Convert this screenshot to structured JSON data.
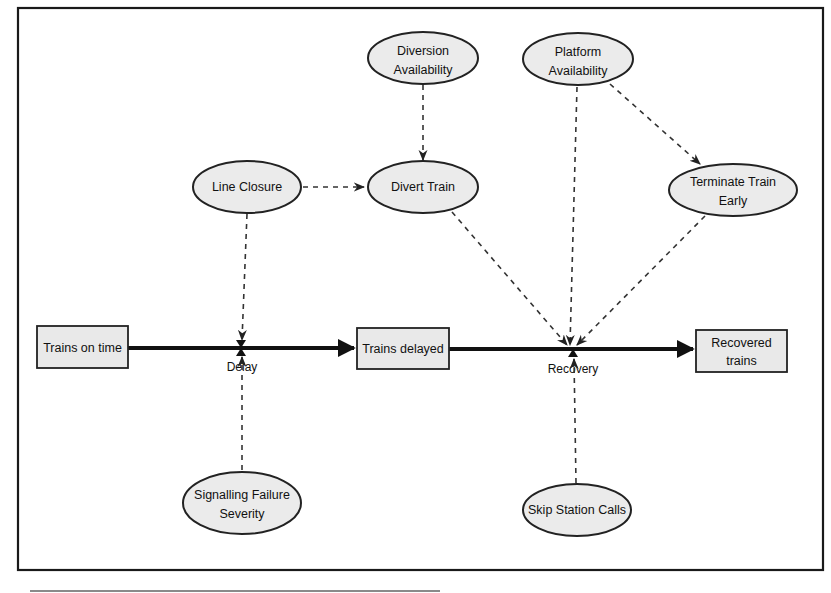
{
  "diagram": {
    "type": "stock-and-flow",
    "stocks": [
      {
        "id": "trains_on_time",
        "label": "Trains on time"
      },
      {
        "id": "trains_delayed",
        "label": "Trains delayed"
      },
      {
        "id": "recovered_trains",
        "label_line1": "Recovered",
        "label_line2": "trains"
      }
    ],
    "flows": [
      {
        "id": "delay",
        "label": "Delay",
        "from": "trains_on_time",
        "to": "trains_delayed"
      },
      {
        "id": "recovery",
        "label": "Recovery",
        "from": "trains_delayed",
        "to": "recovered_trains"
      }
    ],
    "auxiliaries": [
      {
        "id": "diversion_availability",
        "label_line1": "Diversion",
        "label_line2": "Availability"
      },
      {
        "id": "platform_availability",
        "label_line1": "Platform",
        "label_line2": "Availability"
      },
      {
        "id": "line_closure",
        "label": "Line Closure"
      },
      {
        "id": "divert_train",
        "label": "Divert Train"
      },
      {
        "id": "terminate_train_early",
        "label_line1": "Terminate Train",
        "label_line2": "Early"
      },
      {
        "id": "signalling_failure_severity",
        "label_line1": "Signalling Failure",
        "label_line2": "Severity"
      },
      {
        "id": "skip_station_calls",
        "label": "Skip Station Calls"
      }
    ],
    "links": [
      {
        "from": "diversion_availability",
        "to": "divert_train"
      },
      {
        "from": "line_closure",
        "to": "divert_train"
      },
      {
        "from": "line_closure",
        "to": "delay"
      },
      {
        "from": "signalling_failure_severity",
        "to": "delay"
      },
      {
        "from": "platform_availability",
        "to": "terminate_train_early"
      },
      {
        "from": "platform_availability",
        "to": "recovery"
      },
      {
        "from": "divert_train",
        "to": "recovery"
      },
      {
        "from": "terminate_train_early",
        "to": "recovery"
      },
      {
        "from": "skip_station_calls",
        "to": "recovery"
      }
    ],
    "colors": {
      "node_fill": "#ebebeb",
      "stroke": "#222222",
      "background": "#ffffff"
    }
  }
}
